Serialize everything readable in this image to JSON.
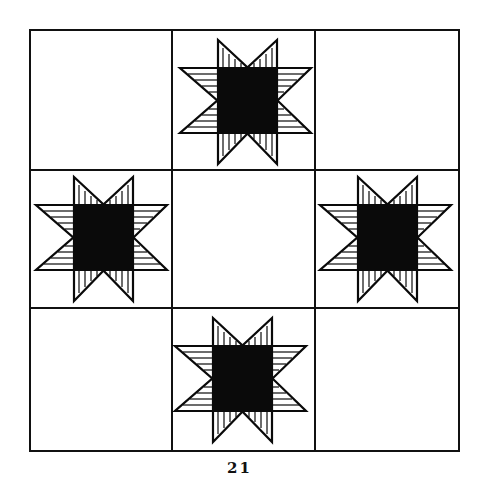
{
  "figure": {
    "caption": "21",
    "grid": {
      "rows": 3,
      "cols": 3,
      "x_lines": [
        30,
        172,
        315,
        459
      ],
      "y_lines": [
        30,
        170,
        308,
        451
      ],
      "line_color": "#111111"
    },
    "stars": [
      {
        "cell": "top-center",
        "x": 180,
        "y": 40
      },
      {
        "cell": "middle-left",
        "x": 36,
        "y": 177
      },
      {
        "cell": "middle-right",
        "x": 318,
        "y": 177
      },
      {
        "cell": "bottom-center",
        "x": 175,
        "y": 318
      }
    ],
    "colors": {
      "ink": "#0a0a0a",
      "paper": "#ffffff"
    }
  }
}
